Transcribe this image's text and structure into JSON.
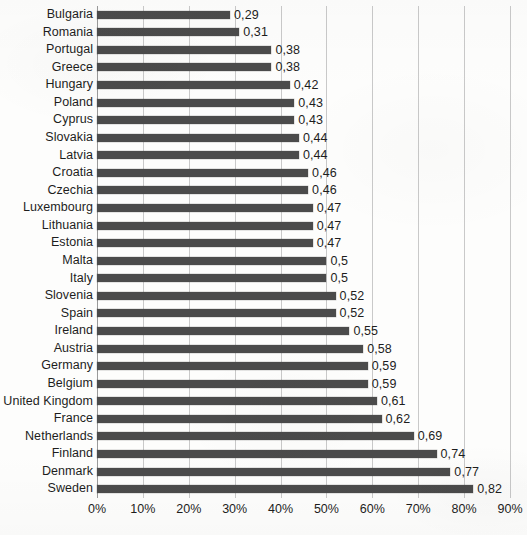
{
  "chart_data": {
    "type": "bar",
    "orientation": "horizontal",
    "title": "",
    "subtitle": "",
    "xlabel": "",
    "ylabel": "",
    "xlim": [
      0,
      0.9
    ],
    "xtick_labels": [
      "0%",
      "10%",
      "20%",
      "30%",
      "40%",
      "50%",
      "60%",
      "70%",
      "80%",
      "90%"
    ],
    "xtick_values": [
      0,
      0.1,
      0.2,
      0.3,
      0.4,
      0.5,
      0.6,
      0.7,
      0.8,
      0.9
    ],
    "grid": true,
    "grid_axis": "x",
    "legend": false,
    "value_label_format": "comma-decimal",
    "bar_color": "#4b4b4b",
    "gridline_color": "#c9c9c9",
    "background_color": "#fdfdfc",
    "categories": [
      "Bulgaria",
      "Romania",
      "Portugal",
      "Greece",
      "Hungary",
      "Poland",
      "Cyprus",
      "Slovakia",
      "Latvia",
      "Croatia",
      "Czechia",
      "Luxembourg",
      "Lithuania",
      "Estonia",
      "Malta",
      "Italy",
      "Slovenia",
      "Spain",
      "Ireland",
      "Austria",
      "Germany",
      "Belgium",
      "United Kingdom",
      "France",
      "Netherlands",
      "Finland",
      "Denmark",
      "Sweden"
    ],
    "values": [
      0.29,
      0.31,
      0.38,
      0.38,
      0.42,
      0.43,
      0.43,
      0.44,
      0.44,
      0.46,
      0.46,
      0.47,
      0.47,
      0.47,
      0.5,
      0.5,
      0.52,
      0.52,
      0.55,
      0.58,
      0.59,
      0.59,
      0.61,
      0.62,
      0.69,
      0.74,
      0.77,
      0.82
    ],
    "value_labels": [
      "0,29",
      "0,31",
      "0,38",
      "0,38",
      "0,42",
      "0,43",
      "0,43",
      "0,44",
      "0,44",
      "0,46",
      "0,46",
      "0,47",
      "0,47",
      "0,47",
      "0,5",
      "0,5",
      "0,52",
      "0,52",
      "0,55",
      "0,58",
      "0,59",
      "0,59",
      "0,61",
      "0,62",
      "0,69",
      "0,74",
      "0,77",
      "0,82"
    ]
  }
}
